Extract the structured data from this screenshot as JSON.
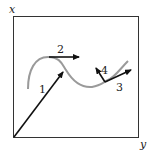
{
  "diagram": {
    "axes": {
      "vertical_label": "x",
      "horizontal_label": "y"
    },
    "curve": {
      "color": "#9a9a9a",
      "description": "wavy trajectory curve"
    },
    "vectors": [
      {
        "label": "1",
        "description": "position vector from origin to curve"
      },
      {
        "label": "2",
        "description": "tangent vector at curve peak"
      },
      {
        "label": "3",
        "description": "tangent vector at right point"
      },
      {
        "label": "4",
        "description": "normal vector at right point"
      }
    ],
    "colors": {
      "frame": "#333333",
      "arrow": "#111111",
      "curve": "#9a9a9a"
    }
  }
}
